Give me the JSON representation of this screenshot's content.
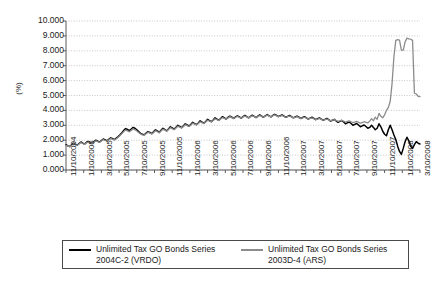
{
  "chart_data": {
    "type": "line",
    "title": "",
    "xlabel": "",
    "ylabel": "(%)",
    "ylim": [
      0,
      10
    ],
    "ytick_labels": [
      "10.000",
      "9.000",
      "8.000",
      "7.000",
      "6.000",
      "5.000",
      "4.000",
      "3.000",
      "2.000",
      "1.000",
      "0.000"
    ],
    "ytick_values": [
      10,
      9,
      8,
      7,
      6,
      5,
      4,
      3,
      2,
      1,
      0
    ],
    "grid": "horizontal-dotted",
    "legend_position": "bottom",
    "x_axis_type": "date",
    "x_tick_labels": [
      "11/10/2004",
      "1/10/2005",
      "3/10/2005",
      "5/10/2005",
      "7/10/2005",
      "9/10/2005",
      "11/10/2005",
      "1/10/2006",
      "3/10/2006",
      "5/10/2006",
      "7/10/2006",
      "9/10/2006",
      "11/10/2006",
      "1/10/2007",
      "3/10/2007",
      "5/10/2007",
      "7/10/2007",
      "9/10/2007",
      "11/10/2007",
      "1/10/2008",
      "3/10/2008"
    ],
    "series": [
      {
        "name": "Unlimited Tax GO Bonds Series 2004C-2 (VRDO)",
        "color": "#000000",
        "values": [
          1.7,
          1.62,
          1.58,
          1.7,
          1.8,
          1.72,
          1.66,
          1.78,
          1.88,
          1.8,
          1.74,
          1.86,
          1.92,
          1.84,
          1.78,
          1.9,
          2.0,
          1.94,
          1.88,
          1.98,
          2.08,
          2.02,
          1.96,
          2.06,
          2.16,
          2.1,
          2.04,
          2.14,
          2.24,
          2.36,
          2.5,
          2.66,
          2.78,
          2.72,
          2.64,
          2.74,
          2.86,
          2.8,
          2.7,
          2.58,
          2.46,
          2.4,
          2.36,
          2.48,
          2.58,
          2.52,
          2.44,
          2.56,
          2.7,
          2.62,
          2.52,
          2.66,
          2.8,
          2.72,
          2.62,
          2.76,
          2.9,
          2.82,
          2.74,
          2.86,
          3.0,
          2.92,
          2.84,
          2.96,
          3.1,
          3.02,
          2.94,
          3.06,
          3.2,
          3.12,
          3.04,
          3.16,
          3.3,
          3.22,
          3.14,
          3.26,
          3.4,
          3.32,
          3.24,
          3.36,
          3.5,
          3.42,
          3.34,
          3.46,
          3.58,
          3.5,
          3.42,
          3.54,
          3.62,
          3.54,
          3.46,
          3.56,
          3.64,
          3.56,
          3.48,
          3.58,
          3.66,
          3.58,
          3.5,
          3.6,
          3.68,
          3.6,
          3.52,
          3.62,
          3.7,
          3.62,
          3.54,
          3.64,
          3.72,
          3.64,
          3.56,
          3.66,
          3.74,
          3.66,
          3.58,
          3.64,
          3.7,
          3.62,
          3.54,
          3.6,
          3.66,
          3.58,
          3.5,
          3.56,
          3.62,
          3.54,
          3.46,
          3.52,
          3.58,
          3.5,
          3.42,
          3.48,
          3.54,
          3.46,
          3.38,
          3.44,
          3.5,
          3.42,
          3.34,
          3.4,
          3.46,
          3.38,
          3.28,
          3.34,
          3.4,
          3.3,
          3.2,
          3.26,
          3.32,
          3.22,
          3.1,
          3.16,
          3.22,
          3.12,
          3.0,
          3.06,
          3.12,
          3.02,
          2.9,
          2.96,
          3.02,
          2.92,
          2.8,
          2.86,
          3.0,
          2.86,
          2.7,
          2.8,
          3.1,
          2.9,
          2.6,
          2.4,
          2.3,
          2.7,
          3.0,
          2.7,
          2.35,
          2.05,
          1.6,
          1.25,
          1.05,
          1.45,
          1.9,
          2.2,
          1.95,
          1.6,
          1.45,
          1.7,
          1.9,
          1.8,
          1.75
        ]
      },
      {
        "name": "Unlimited Tax GO Bonds Series 2003D-4 (ARS)",
        "color": "#8c8c8c",
        "values": [
          1.66,
          1.6,
          1.56,
          1.66,
          1.76,
          1.7,
          1.64,
          1.74,
          1.84,
          1.78,
          1.72,
          1.82,
          1.88,
          1.82,
          1.76,
          1.86,
          1.96,
          1.9,
          1.86,
          1.94,
          2.04,
          1.98,
          1.94,
          2.02,
          2.12,
          2.06,
          2.02,
          2.1,
          2.2,
          2.32,
          2.44,
          2.58,
          2.68,
          2.62,
          2.56,
          2.66,
          2.76,
          2.7,
          2.62,
          2.52,
          2.42,
          2.36,
          2.34,
          2.44,
          2.54,
          2.48,
          2.42,
          2.52,
          2.64,
          2.58,
          2.5,
          2.62,
          2.74,
          2.68,
          2.6,
          2.72,
          2.84,
          2.78,
          2.7,
          2.82,
          2.94,
          2.88,
          2.82,
          2.92,
          3.04,
          2.98,
          2.92,
          3.02,
          3.14,
          3.08,
          3.02,
          3.12,
          3.24,
          3.18,
          3.12,
          3.22,
          3.34,
          3.28,
          3.22,
          3.32,
          3.44,
          3.38,
          3.32,
          3.42,
          3.52,
          3.46,
          3.4,
          3.5,
          3.58,
          3.52,
          3.46,
          3.54,
          3.6,
          3.54,
          3.48,
          3.56,
          3.62,
          3.56,
          3.5,
          3.58,
          3.64,
          3.58,
          3.52,
          3.6,
          3.66,
          3.6,
          3.54,
          3.62,
          3.68,
          3.62,
          3.56,
          3.64,
          3.7,
          3.64,
          3.58,
          3.62,
          3.66,
          3.6,
          3.54,
          3.58,
          3.62,
          3.56,
          3.5,
          3.54,
          3.58,
          3.52,
          3.46,
          3.5,
          3.54,
          3.48,
          3.42,
          3.46,
          3.5,
          3.44,
          3.38,
          3.42,
          3.46,
          3.4,
          3.34,
          3.38,
          3.42,
          3.36,
          3.3,
          3.34,
          3.38,
          3.32,
          3.26,
          3.3,
          3.34,
          3.28,
          3.22,
          3.26,
          3.3,
          3.24,
          3.18,
          3.22,
          3.26,
          3.2,
          3.14,
          3.18,
          3.24,
          3.2,
          3.16,
          3.28,
          3.45,
          3.3,
          3.55,
          3.4,
          3.8,
          3.6,
          3.5,
          3.7,
          4.0,
          4.2,
          4.6,
          5.8,
          7.6,
          8.7,
          8.75,
          8.72,
          8.05,
          8.05,
          8.6,
          8.85,
          8.8,
          8.78,
          8.7,
          5.15,
          5.1,
          4.95,
          4.92
        ]
      }
    ]
  },
  "legend": {
    "entries": [
      {
        "label_line1": "Unlimited Tax GO Bonds Series",
        "label_line2": "2004C-2 (VRDO)"
      },
      {
        "label_line1": "Unlimited Tax GO Bonds Series",
        "label_line2": "2003D-4 (ARS)"
      }
    ]
  }
}
